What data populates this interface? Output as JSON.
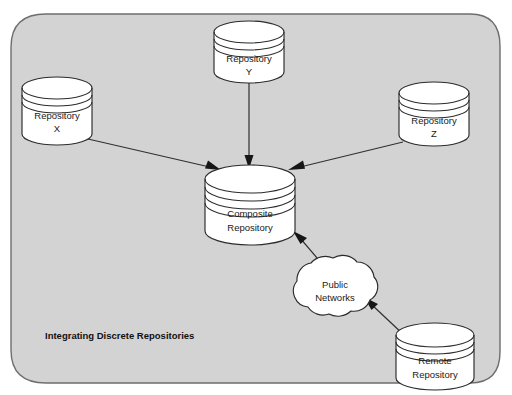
{
  "diagram": {
    "caption": "Integrating Discrete Repositories",
    "panel": {
      "name": "integration-panel",
      "fill_color": "#d3d3d3",
      "border_color": "#6e6e6e"
    },
    "nodes": [
      {
        "id": "repository-x",
        "type": "cylinder",
        "line1": "Repository",
        "line2": "X",
        "disc_lines": 2
      },
      {
        "id": "repository-y",
        "type": "cylinder",
        "line1": "Repository",
        "line2": "Y",
        "disc_lines": 2
      },
      {
        "id": "repository-z",
        "type": "cylinder",
        "line1": "Repository",
        "line2": "Z",
        "disc_lines": 2
      },
      {
        "id": "composite-repository",
        "type": "cylinder",
        "line1": "Composite",
        "line2": "Repository",
        "disc_lines": 3
      },
      {
        "id": "public-networks",
        "type": "cloud",
        "line1": "Public",
        "line2": "Networks"
      },
      {
        "id": "remote-repository",
        "type": "cylinder",
        "line1": "Remote",
        "line2": "Repository",
        "disc_lines": 3
      }
    ],
    "connectors": [
      {
        "id": "x-to-composite",
        "from": "repository-x",
        "to": "composite-repository"
      },
      {
        "id": "y-to-composite",
        "from": "repository-y",
        "to": "composite-repository"
      },
      {
        "id": "z-to-composite",
        "from": "repository-z",
        "to": "composite-repository"
      },
      {
        "id": "networks-to-composite",
        "from": "public-networks",
        "to": "composite-repository"
      },
      {
        "id": "remote-to-networks",
        "from": "remote-repository",
        "to": "public-networks"
      }
    ]
  }
}
